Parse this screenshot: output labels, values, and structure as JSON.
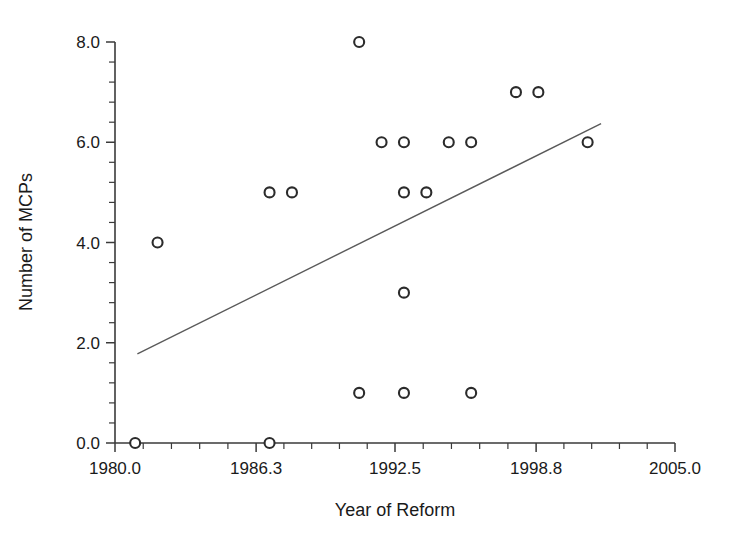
{
  "chart_data": {
    "type": "scatter",
    "title": "",
    "xlabel": "Year of Reform",
    "ylabel": "Number of MCPs",
    "xlim": [
      1980.0,
      2005.0
    ],
    "ylim": [
      0.0,
      8.0
    ],
    "grid": false,
    "legend": null,
    "x_tick_labels": [
      "1980.0",
      "1986.3",
      "1992.5",
      "1998.8",
      "2005.0"
    ],
    "x_tick_values": [
      1980.0,
      1986.3,
      1992.5,
      1998.8,
      2005.0
    ],
    "x_minor_tick_count_between_majors": 5,
    "y_tick_labels": [
      "0.0",
      "2.0",
      "4.0",
      "6.0",
      "8.0"
    ],
    "y_tick_values": [
      0.0,
      2.0,
      4.0,
      6.0,
      8.0
    ],
    "y_minor_tick_count_between_majors": 4,
    "marker": "open-circle",
    "marker_radius_px": 5,
    "points": [
      {
        "x": 1980.9,
        "y": 0
      },
      {
        "x": 1986.9,
        "y": 0
      },
      {
        "x": 1981.9,
        "y": 4
      },
      {
        "x": 1986.9,
        "y": 5
      },
      {
        "x": 1987.9,
        "y": 5
      },
      {
        "x": 1990.9,
        "y": 8
      },
      {
        "x": 1990.9,
        "y": 1
      },
      {
        "x": 1991.9,
        "y": 6
      },
      {
        "x": 1992.9,
        "y": 6
      },
      {
        "x": 1992.9,
        "y": 5
      },
      {
        "x": 1992.9,
        "y": 3
      },
      {
        "x": 1992.9,
        "y": 1
      },
      {
        "x": 1993.9,
        "y": 5
      },
      {
        "x": 1994.9,
        "y": 6
      },
      {
        "x": 1995.9,
        "y": 6
      },
      {
        "x": 1995.9,
        "y": 1
      },
      {
        "x": 1997.9,
        "y": 7
      },
      {
        "x": 1998.9,
        "y": 7
      },
      {
        "x": 2001.1,
        "y": 6
      }
    ],
    "trendline": {
      "type": "linear-fit",
      "x_start": 1981.0,
      "y_start": 1.78,
      "x_end": 2001.7,
      "y_end": 6.37
    }
  },
  "axes": {
    "x_axis_name": "Year of Reform",
    "y_axis_name": "Number of MCPs"
  }
}
